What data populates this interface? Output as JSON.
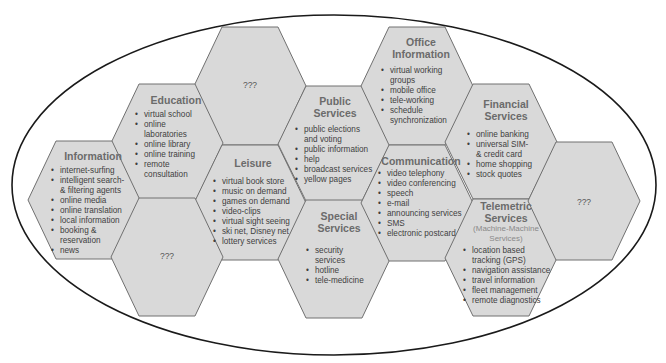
{
  "diagram": {
    "type": "hexagon-cluster-in-ellipse",
    "colors": {
      "hex_fill": "#d9d9d9",
      "hex_stroke": "#707070",
      "ellipse_stroke": "#1a1a1a",
      "title": "#6b6b6b",
      "text": "#3f3f3f"
    },
    "hexagons": {
      "information": {
        "title": "Information",
        "items": [
          "internet-surfing",
          "intelligent search-\n& filtering agents",
          "online media",
          "online translation",
          "local information",
          "booking &\nreservation",
          "news"
        ]
      },
      "education": {
        "title": "Education",
        "items": [
          "virtual  school",
          "online\nlaboratories",
          "online library",
          "online training",
          "remote\nconsultation"
        ]
      },
      "unknown_top": {
        "title": "???"
      },
      "leisure": {
        "title": "Leisure",
        "items": [
          "virtual book store",
          "music on demand",
          "games on demand",
          "video-clips",
          "virtual sight seeing",
          "ski net, Disney net",
          "lottery services"
        ]
      },
      "unknown_bottom": {
        "title": "???"
      },
      "public_services": {
        "title": "Public\nServices",
        "items": [
          "public elections\nand voting",
          "public information",
          "help",
          "broadcast services",
          "yellow pages"
        ]
      },
      "special_services": {
        "title": "Special\nServices",
        "items": [
          "security\nservices",
          "hotline",
          "tele-medicine"
        ]
      },
      "office_information": {
        "title": "Office\nInformation",
        "items": [
          "virtual working\ngroups",
          "mobile office",
          "tele-working",
          "schedule\nsynchronization"
        ]
      },
      "communication": {
        "title": "Communication",
        "items": [
          "video telephony",
          "video conferencing",
          "speech",
          "e-mail",
          "announcing services",
          "SMS",
          "electronic postcard"
        ]
      },
      "financial_services": {
        "title": "Financial\nServices",
        "items": [
          "online banking",
          "universal SIM-\n& credit card",
          "home shopping",
          "stock quotes"
        ]
      },
      "telemetric_services": {
        "title": "Telemetric\nServices",
        "subtitle": "(Machine-Machine\nServices)",
        "items": [
          "location based\ntracking (GPS)",
          "navigation assistance",
          "travel information",
          "fleet management",
          "remote diagnostics"
        ]
      },
      "unknown_right": {
        "title": "???"
      }
    }
  }
}
